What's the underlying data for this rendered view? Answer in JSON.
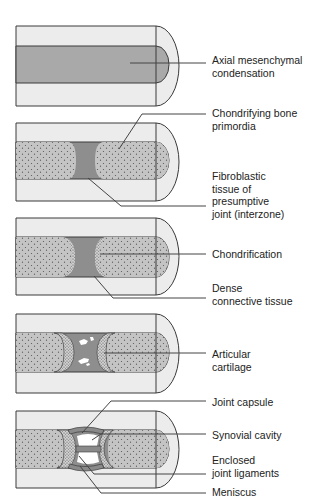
{
  "figure": {
    "colors": {
      "outer_mesenchyme": "#ececec",
      "condensation": "#a9a9a9",
      "stipple_fill": "#c4c4c4",
      "dense_tissue": "#8e8e8e",
      "outline": "#3a3a3a",
      "leader_line": "#444444",
      "text": "#222222"
    },
    "panels": [
      {
        "id": "stage-1",
        "labels": [
          {
            "lines": [
              "Axial mesenchymal",
              "condensation"
            ]
          }
        ]
      },
      {
        "id": "stage-2",
        "labels": [
          {
            "lines": [
              "Chondrifying bone",
              "primordia"
            ]
          },
          {
            "lines": [
              "Fibroblastic",
              "tissue of",
              "presumptive",
              "joint (interzone)"
            ]
          }
        ]
      },
      {
        "id": "stage-3",
        "labels": [
          {
            "lines": [
              "Chondrification"
            ]
          },
          {
            "lines": [
              "Dense",
              "connective tissue"
            ]
          }
        ]
      },
      {
        "id": "stage-4",
        "labels": [
          {
            "lines": [
              "Articular",
              "cartilage"
            ]
          }
        ]
      },
      {
        "id": "stage-5",
        "labels": [
          {
            "lines": [
              "Joint capsule"
            ]
          },
          {
            "lines": [
              "Synovial cavity"
            ]
          },
          {
            "lines": [
              "Enclosed",
              "joint ligaments"
            ]
          },
          {
            "lines": [
              "Meniscus"
            ]
          }
        ]
      }
    ]
  }
}
